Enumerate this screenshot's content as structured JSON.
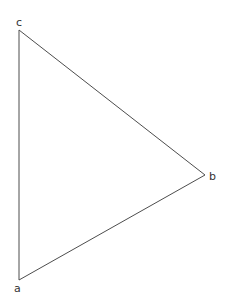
{
  "figure": {
    "type": "triangle-diagram",
    "title": "",
    "width": 236,
    "height": 307,
    "background_color": "#ffffff",
    "stroke_color": "#4d4d4d",
    "stroke_width": 1,
    "label_color": "#333333",
    "vertices": [
      {
        "id": "a",
        "label": "a",
        "x": 19,
        "y": 280,
        "label_x": 14,
        "label_y": 283
      },
      {
        "id": "b",
        "label": "b",
        "x": 205,
        "y": 175,
        "label_x": 209,
        "label_y": 171
      },
      {
        "id": "c",
        "label": "c",
        "x": 19,
        "y": 30,
        "label_x": 16,
        "label_y": 17
      }
    ],
    "edges": [
      {
        "id": "ca",
        "from": "c",
        "to": "a"
      },
      {
        "id": "cb",
        "from": "c",
        "to": "b"
      },
      {
        "id": "ab",
        "from": "a",
        "to": "b"
      }
    ],
    "path": "M 19,30 L 205,175 L 19,280 Z"
  }
}
